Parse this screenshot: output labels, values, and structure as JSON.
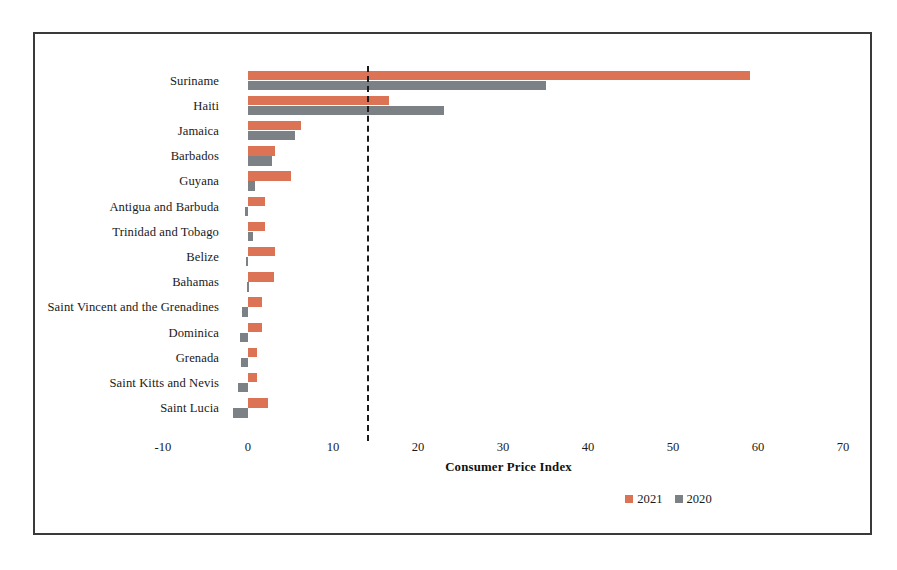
{
  "chart_data": {
    "type": "bar",
    "orientation": "horizontal",
    "title": "",
    "xlabel": "Consumer Price Index",
    "ylabel": "",
    "xlim": [
      -10,
      70
    ],
    "xticks": [
      -10,
      0,
      10,
      20,
      30,
      40,
      50,
      60,
      70
    ],
    "xticklabels": [
      "-10",
      "0",
      "10",
      "20",
      "30",
      "40",
      "50",
      "60",
      "70"
    ],
    "grid": false,
    "legend_position": "bottom-right",
    "reference_line": {
      "value": 14,
      "style": "dashed",
      "color": "#1a1a1a"
    },
    "categories": [
      "Suriname",
      "Haiti",
      "Jamaica",
      "Barbados",
      "Guyana",
      "Antigua and Barbuda",
      "Trinidad and Tobago",
      "Belize",
      "Bahamas",
      "Saint Vincent and the Grenadines",
      "Dominica",
      "Grenada",
      "Saint Kitts and Nevis",
      "Saint Lucia"
    ],
    "series": [
      {
        "name": "2021",
        "color": "#dc7355",
        "values": [
          59.0,
          16.6,
          6.2,
          3.2,
          5.0,
          2.0,
          2.0,
          3.2,
          3.0,
          1.6,
          1.6,
          1.1,
          1.1,
          2.4
        ]
      },
      {
        "name": "2020",
        "color": "#7c8185",
        "values": [
          35.0,
          23.0,
          5.5,
          2.8,
          0.8,
          -0.4,
          0.6,
          -0.2,
          -0.1,
          -0.7,
          -0.9,
          -0.8,
          -1.2,
          -1.8
        ]
      }
    ]
  },
  "legend": {
    "items": [
      {
        "label": "2021",
        "color": "#dc7355"
      },
      {
        "label": "2020",
        "color": "#7c8185"
      }
    ]
  },
  "axis": {
    "x_title": "Consumer Price Index"
  }
}
